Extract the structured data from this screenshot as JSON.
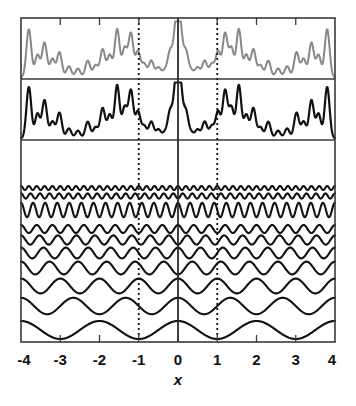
{
  "figure": {
    "title": "",
    "background_color": "#ffffff",
    "width": 356,
    "height": 406
  },
  "axis": {
    "xlabel": "x",
    "tick_labels": [
      "-4",
      "-3",
      "-2",
      "-1",
      "0",
      "1",
      "2",
      "3",
      "4"
    ],
    "tick_values": [
      -4,
      -3,
      -2,
      -1,
      0,
      1,
      2,
      3,
      4
    ],
    "xlim": [
      -4,
      4
    ],
    "label_color": "#111111",
    "frame_color": "#3a3a3a"
  },
  "guides": {
    "solid_line_x": 0,
    "solid_line_color": "#2b2b2b",
    "dotted_line_x": [
      -1,
      1
    ],
    "dotted_line_color": "#111111",
    "dotted_pattern": "2,3"
  },
  "panels": [
    {
      "name": "upper-spectrum-panel",
      "trace_color": "#888888",
      "y_top": 18,
      "y_bottom": 79
    },
    {
      "name": "lower-spectrum-panel",
      "trace_color": "#111111",
      "y_top": 79,
      "y_bottom": 140
    },
    {
      "name": "mode-stack-panel",
      "trace_color": "#111111",
      "y_top": 140,
      "y_bottom": 342
    }
  ],
  "chart_data": {
    "type": "line",
    "title": "",
    "xlabel": "x",
    "ylabel": "",
    "xlim": [
      -4,
      4
    ],
    "grid": false,
    "legend": null,
    "x_tick_labels": [
      "-4",
      "-3",
      "-2",
      "-1",
      "0",
      "1",
      "2",
      "3",
      "4"
    ],
    "x_tick_values": [
      -4,
      -3,
      -2,
      -1,
      0,
      1,
      2,
      3,
      4
    ],
    "vertical_markers": [
      {
        "x": 0,
        "style": "solid"
      },
      {
        "x": -1,
        "style": "dotted"
      },
      {
        "x": 1,
        "style": "dotted"
      }
    ],
    "series": [
      {
        "name": "upper-spectrum",
        "panel": "upper-spectrum-panel",
        "color": "#888888",
        "type": "line",
        "symmetry": "even",
        "peaks_half_domain": [
          {
            "x": -3.8,
            "height": 0.86
          },
          {
            "x": -3.58,
            "height": 0.4
          },
          {
            "x": -3.4,
            "height": 0.62
          },
          {
            "x": -3.2,
            "height": 0.33
          },
          {
            "x": -3.02,
            "height": 0.45
          },
          {
            "x": -2.78,
            "height": 0.2
          },
          {
            "x": -2.55,
            "height": 0.16
          },
          {
            "x": -2.3,
            "height": 0.3
          },
          {
            "x": -2.1,
            "height": 0.22
          },
          {
            "x": -1.92,
            "height": 0.5
          },
          {
            "x": -1.74,
            "height": 0.4
          },
          {
            "x": -1.55,
            "height": 0.86
          },
          {
            "x": -1.36,
            "height": 0.52
          },
          {
            "x": -1.2,
            "height": 0.78
          },
          {
            "x": -1.02,
            "height": 0.46
          },
          {
            "x": -0.86,
            "height": 0.24
          },
          {
            "x": -0.68,
            "height": 0.3
          },
          {
            "x": -0.5,
            "height": 0.18
          },
          {
            "x": -0.34,
            "height": 0.12
          },
          {
            "x": -0.2,
            "height": 0.46
          },
          {
            "x": -0.05,
            "height": 0.88
          }
        ]
      },
      {
        "name": "lower-spectrum",
        "panel": "lower-spectrum-panel",
        "color": "#111111",
        "type": "line",
        "symmetry": "even",
        "peaks_half_domain": [
          {
            "x": -3.8,
            "height": 0.92
          },
          {
            "x": -3.58,
            "height": 0.44
          },
          {
            "x": -3.4,
            "height": 0.68
          },
          {
            "x": -3.2,
            "height": 0.3
          },
          {
            "x": -3.02,
            "height": 0.46
          },
          {
            "x": -2.78,
            "height": 0.18
          },
          {
            "x": -2.55,
            "height": 0.14
          },
          {
            "x": -2.3,
            "height": 0.3
          },
          {
            "x": -2.1,
            "height": 0.2
          },
          {
            "x": -1.92,
            "height": 0.54
          },
          {
            "x": -1.74,
            "height": 0.42
          },
          {
            "x": -1.55,
            "height": 0.95
          },
          {
            "x": -1.36,
            "height": 0.55
          },
          {
            "x": -1.2,
            "height": 0.85
          },
          {
            "x": -1.02,
            "height": 0.48
          },
          {
            "x": -0.86,
            "height": 0.22
          },
          {
            "x": -0.68,
            "height": 0.3
          },
          {
            "x": -0.5,
            "height": 0.16
          },
          {
            "x": -0.34,
            "height": 0.1
          },
          {
            "x": -0.2,
            "height": 0.48
          },
          {
            "x": -0.05,
            "height": 0.96
          }
        ]
      }
    ],
    "mode_stack": {
      "name": "mode-stack",
      "panel": "mode-stack-panel",
      "color": "#111111",
      "line_width": 2.1,
      "count": 10,
      "note": "index 0 = bottom (lowest frequency, largest amplitude); cycles = number of full periods across the full x range of width 8",
      "modes": [
        {
          "index": 0,
          "cycles": 4,
          "amplitude": 9.0,
          "baseline_y": 330,
          "phase": "cos"
        },
        {
          "index": 1,
          "cycles": 6,
          "amplitude": 8.2,
          "baseline_y": 306,
          "phase": "cos"
        },
        {
          "index": 2,
          "cycles": 8,
          "amplitude": 7.4,
          "baseline_y": 286,
          "phase": "cos"
        },
        {
          "index": 3,
          "cycles": 11,
          "amplitude": 6.4,
          "baseline_y": 268,
          "phase": "cos"
        },
        {
          "index": 4,
          "cycles": 14,
          "amplitude": 5.4,
          "baseline_y": 253,
          "phase": "cos"
        },
        {
          "index": 5,
          "cycles": 17,
          "amplitude": 4.6,
          "baseline_y": 240,
          "phase": "cos"
        },
        {
          "index": 6,
          "cycles": 20,
          "amplitude": 4.0,
          "baseline_y": 229,
          "phase": "cos"
        },
        {
          "index": 7,
          "cycles": 26,
          "amplitude": 7.2,
          "baseline_y": 210,
          "phase": "cos"
        },
        {
          "index": 8,
          "cycles": 33,
          "amplitude": 2.6,
          "baseline_y": 196,
          "phase": "cos"
        },
        {
          "index": 9,
          "cycles": 40,
          "amplitude": 2.0,
          "baseline_y": 188,
          "phase": "cos"
        }
      ]
    }
  }
}
